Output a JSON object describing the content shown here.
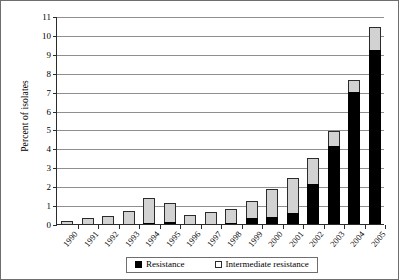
{
  "figure": {
    "frame_color": "#6e6e6e",
    "background": "#ffffff"
  },
  "axes": {
    "y_title": "Percent of isolates",
    "y_ticks": [
      "0",
      "1",
      "2",
      "3",
      "4",
      "5",
      "6",
      "7",
      "8",
      "9",
      "10",
      "11"
    ]
  },
  "legend": {
    "items": [
      {
        "label": "Resistance",
        "swatch": "black-filled-square",
        "color": "#000000"
      },
      {
        "label": "Intermediate resistance",
        "swatch": "white-open-square",
        "color": "#ffffff"
      }
    ]
  },
  "chart_data": {
    "type": "bar",
    "stacked": true,
    "title": "",
    "xlabel": "",
    "ylabel": "Percent of isolates",
    "ylim": [
      0,
      11
    ],
    "ytick_step": 1,
    "grid": true,
    "grid_axis": "y",
    "legend_position": "bottom-center",
    "categories": [
      "1990",
      "1991",
      "1992",
      "1993",
      "1994",
      "1995",
      "1996",
      "1997",
      "1998",
      "1999",
      "2000",
      "2001",
      "2002",
      "2003",
      "2004",
      "2005"
    ],
    "series": [
      {
        "name": "Resistance",
        "color": "#000000",
        "values": [
          0,
          0,
          0,
          0,
          0.05,
          0.1,
          0,
          0,
          0.05,
          0.3,
          0.35,
          0.6,
          2.1,
          4.1,
          7.0,
          9.2
        ]
      },
      {
        "name": "Intermediate resistance",
        "color": "#d2d2d2",
        "values": [
          0.15,
          0.3,
          0.4,
          0.7,
          1.3,
          1.0,
          0.5,
          0.65,
          0.75,
          0.9,
          1.5,
          1.85,
          1.4,
          0.8,
          0.6,
          1.2
        ]
      }
    ],
    "totals": [
      0.15,
      0.3,
      0.4,
      0.7,
      1.35,
      1.1,
      0.5,
      0.65,
      0.8,
      1.2,
      1.85,
      2.45,
      3.5,
      4.9,
      7.6,
      10.4
    ]
  }
}
